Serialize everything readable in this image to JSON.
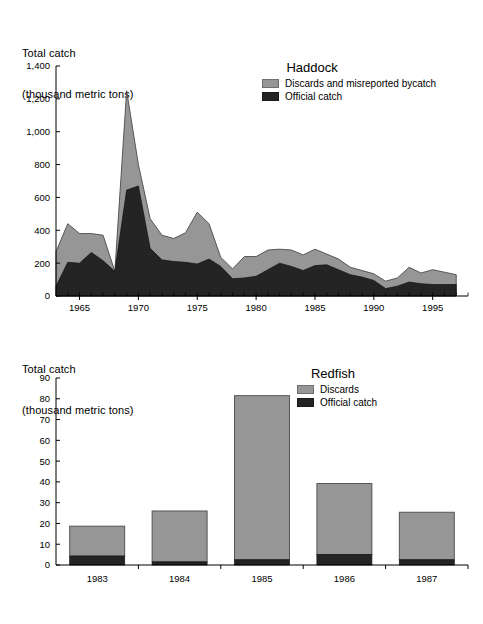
{
  "figure": {
    "background": "#ffffff",
    "colors": {
      "discards": "#969696",
      "official": "#242424",
      "axis": "#000000",
      "outline": "#4a4a4a"
    }
  },
  "panels": [
    {
      "id": "haddock",
      "axis_title_line1": "Total catch",
      "axis_title_line2": "(thousand metric tons)",
      "legend": {
        "title": "Haddock",
        "items": [
          {
            "label": "Discards and misreported bycatch",
            "color": "#969696"
          },
          {
            "label": "Official catch",
            "color": "#242424"
          }
        ]
      }
    },
    {
      "id": "redfish",
      "axis_title_line1": "Total catch",
      "axis_title_line2": "(thousand metric tons)",
      "legend": {
        "title": "Redfish",
        "items": [
          {
            "label": "Discards",
            "color": "#969696"
          },
          {
            "label": "Official catch",
            "color": "#242424"
          }
        ]
      }
    }
  ],
  "chart_data": [
    {
      "type": "area",
      "id": "haddock",
      "title": "Haddock",
      "xlabel": "",
      "ylabel": "Total catch (thousand metric tons)",
      "stacked": true,
      "grid": false,
      "legend_position": "top-right",
      "xlim": [
        1963,
        1998
      ],
      "ylim": [
        0,
        1400
      ],
      "ytick_labels": [
        "0",
        "200",
        "400",
        "600",
        "800",
        "1,000",
        "1,200",
        "1,400"
      ],
      "yticks": [
        0,
        200,
        400,
        600,
        800,
        1000,
        1200,
        1400
      ],
      "xtick_labels": [
        "1965",
        "1970",
        "1975",
        "1980",
        "1985",
        "1990",
        "1995"
      ],
      "xticks": [
        1965,
        1970,
        1975,
        1980,
        1985,
        1990,
        1995
      ],
      "minor_xticks_every": 1,
      "x": [
        1963,
        1964,
        1965,
        1966,
        1967,
        1968,
        1969,
        1970,
        1971,
        1972,
        1973,
        1974,
        1975,
        1976,
        1977,
        1978,
        1979,
        1980,
        1981,
        1982,
        1983,
        1984,
        1985,
        1986,
        1987,
        1988,
        1989,
        1990,
        1991,
        1992,
        1993,
        1994,
        1995,
        1996,
        1997
      ],
      "series": [
        {
          "name": "Official catch",
          "color": "#242424",
          "values": [
            60,
            205,
            200,
            265,
            215,
            150,
            645,
            670,
            290,
            220,
            210,
            205,
            195,
            225,
            180,
            105,
            110,
            120,
            160,
            200,
            180,
            155,
            185,
            190,
            160,
            130,
            115,
            95,
            45,
            60,
            85,
            75,
            70,
            70,
            70
          ]
        },
        {
          "name": "Discards and misreported bycatch",
          "color": "#969696",
          "values": [
            210,
            235,
            180,
            115,
            155,
            0,
            605,
            130,
            180,
            150,
            140,
            180,
            315,
            215,
            55,
            60,
            130,
            120,
            120,
            85,
            100,
            95,
            100,
            65,
            65,
            45,
            40,
            40,
            45,
            50,
            90,
            65,
            90,
            75,
            60
          ]
        }
      ],
      "totals": [
        270,
        440,
        380,
        380,
        370,
        150,
        1250,
        800,
        470,
        370,
        350,
        385,
        510,
        440,
        235,
        165,
        240,
        240,
        280,
        285,
        280,
        250,
        285,
        255,
        225,
        175,
        155,
        135,
        90,
        110,
        175,
        140,
        160,
        145,
        130
      ]
    },
    {
      "type": "bar",
      "id": "redfish",
      "title": "Redfish",
      "xlabel": "",
      "ylabel": "Total catch (thousand metric tons)",
      "stacked": true,
      "grid": false,
      "legend_position": "top-right",
      "ylim": [
        0,
        90
      ],
      "yticks": [
        0,
        10,
        20,
        30,
        40,
        50,
        60,
        70,
        80,
        90
      ],
      "ytick_labels": [
        "0",
        "10",
        "20",
        "30",
        "40",
        "50",
        "60",
        "70",
        "80",
        "90"
      ],
      "categories": [
        "1983",
        "1984",
        "1985",
        "1986",
        "1987"
      ],
      "series": [
        {
          "name": "Official catch",
          "color": "#242424",
          "values": [
            4.3,
            1.5,
            2.5,
            5.0,
            2.5
          ]
        },
        {
          "name": "Discards",
          "color": "#969696",
          "values": [
            14.4,
            24.5,
            79.0,
            34.2,
            22.9
          ]
        }
      ],
      "totals": [
        18.7,
        26.0,
        81.5,
        39.2,
        25.4
      ]
    }
  ]
}
